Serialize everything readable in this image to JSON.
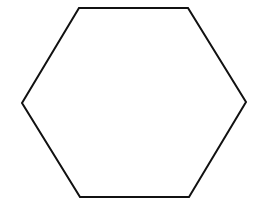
{
  "diagram": {
    "shape": "hexagon",
    "orientation": "flat-top",
    "stroke_color": "#111111",
    "fill_color": "#ffffff",
    "background": "#ffffff",
    "stroke_width": 2,
    "vertices": [
      [
        79,
        8
      ],
      [
        188,
        8
      ],
      [
        246,
        102
      ],
      [
        189,
        197
      ],
      [
        80,
        197
      ],
      [
        22,
        103
      ]
    ]
  }
}
